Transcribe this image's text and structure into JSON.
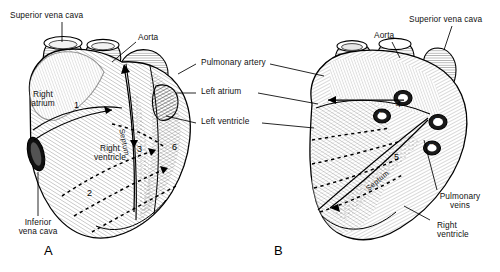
{
  "figure": {
    "type": "anatomical-illustration",
    "background_color": "#ffffff",
    "ink_color": "#000000"
  },
  "panels": [
    {
      "letter": "A",
      "view": "anterior"
    },
    {
      "letter": "B",
      "view": "posterior"
    }
  ],
  "labels_left_panel": [
    {
      "id": "superior-vena-cava-a",
      "text": "Superior vena cava"
    },
    {
      "id": "aorta-a",
      "text": "Aorta"
    },
    {
      "id": "right-atrium-a",
      "line1": "Right",
      "line2": "atrium"
    },
    {
      "id": "right-ventricle-a",
      "line1": "Right",
      "line2": "ventricle"
    },
    {
      "id": "inferior-vena-cava-a",
      "line1": "Inferior",
      "line2": "vena cava"
    },
    {
      "id": "septum-a",
      "text": "Septum"
    }
  ],
  "labels_center": [
    {
      "id": "pulmonary-artery",
      "text": "Pulmonary artery"
    },
    {
      "id": "left-atrium",
      "text": "Left atrium"
    },
    {
      "id": "left-ventricle",
      "text": "Left ventricle"
    }
  ],
  "labels_right_panel": [
    {
      "id": "aorta-b",
      "text": "Aorta"
    },
    {
      "id": "superior-vena-cava-b",
      "text": "Superior vena cava"
    },
    {
      "id": "pulmonary-veins-b",
      "line1": "Pulmonary",
      "line2": "veins"
    },
    {
      "id": "right-ventricle-b",
      "line1": "Right",
      "line2": "ventricle"
    },
    {
      "id": "septum-b",
      "text": "Septum"
    }
  ],
  "markers": [
    {
      "id": "marker-1",
      "text": "1",
      "panel": "A"
    },
    {
      "id": "marker-2",
      "text": "2",
      "panel": "A"
    },
    {
      "id": "marker-3",
      "text": "3",
      "panel": "A"
    },
    {
      "id": "marker-6",
      "text": "6",
      "panel": "A"
    },
    {
      "id": "marker-4",
      "text": "4",
      "panel": "B"
    },
    {
      "id": "marker-5",
      "text": "5",
      "panel": "B"
    }
  ],
  "vessel_openings": [
    {
      "id": "opening-left-superior",
      "text": "L"
    },
    {
      "id": "opening-left-inferior",
      "text": "L"
    },
    {
      "id": "opening-right-superior",
      "text": "R"
    },
    {
      "id": "opening-right-inferior",
      "text": "R"
    }
  ]
}
